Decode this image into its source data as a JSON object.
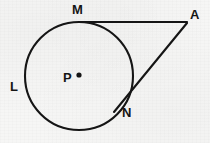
{
  "figure": {
    "type": "geometry-diagram",
    "background_color": "#f6f6f5",
    "ink_color": "#151515",
    "canvas": {
      "width": 210,
      "height": 143
    },
    "circle": {
      "label": "L",
      "center_label": "P",
      "center": {
        "x": 79,
        "y": 76
      },
      "radius": 54,
      "stroke_width": 2.1
    },
    "center_dot": {
      "x": 79,
      "y": 75,
      "radius": 2.6
    },
    "points": [
      {
        "id": "M",
        "label": "M",
        "x": 82,
        "y": 22,
        "label_x": 72,
        "label_y": 3,
        "role": "tangent-point-upper"
      },
      {
        "id": "A",
        "label": "A",
        "x": 186,
        "y": 22,
        "label_x": 190,
        "label_y": 8,
        "role": "external-vertex"
      },
      {
        "id": "N",
        "label": "N",
        "x": 118,
        "y": 105,
        "label_x": 122,
        "label_y": 106,
        "role": "tangent-point-lower"
      },
      {
        "id": "P",
        "label": "P",
        "x": 79,
        "y": 76,
        "label_x": 63,
        "label_y": 71,
        "role": "circle-center"
      },
      {
        "id": "L",
        "label": "L",
        "x": 25,
        "y": 88,
        "label_x": 10,
        "label_y": 80,
        "role": "circle-arc-label"
      }
    ],
    "segments": [
      {
        "id": "MA",
        "from": "M",
        "to": "A",
        "x1": 81,
        "y1": 22,
        "x2": 187,
        "y2": 22,
        "stroke_width": 2.1,
        "role": "tangent-segment-upper"
      },
      {
        "id": "AN",
        "from": "A",
        "to": "N",
        "x1": 187,
        "y1": 23,
        "x2": 114,
        "y2": 112,
        "stroke_width": 2.1,
        "role": "tangent-segment-lower"
      }
    ],
    "bleed_through_text": [
      "",
      "",
      "",
      "",
      "",
      ""
    ]
  }
}
